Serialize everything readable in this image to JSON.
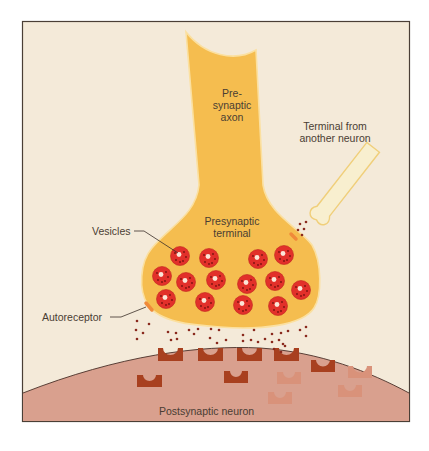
{
  "figure": {
    "colors": {
      "background": "#f4ead9",
      "frame": "#4a3f36",
      "axon_fill": "#f5bd4f",
      "axon_outline": "#fbe0a0",
      "vesicle": "#e2302a",
      "vesicle_dot": "#7a1410",
      "neurotransmitter": "#8a2a1e",
      "postsynaptic": "#d9a08e",
      "receptor_dark": "#a8401f",
      "receptor_faded": "#d9927a",
      "autoreceptor_patch": "#f08a3a",
      "other_terminal_fill": "#f8efcf",
      "other_terminal_outline": "#f0cf7a"
    }
  },
  "labels": {
    "axon_line1": "Pre-",
    "axon_line2": "synaptic",
    "axon_line3": "axon",
    "terminal_line1": "Presynaptic",
    "terminal_line2": "terminal",
    "other_line1": "Terminal from",
    "other_line2": "another neuron",
    "vesicles": "Vesicles",
    "autoreceptor": "Autoreceptor",
    "postsynaptic": "Postsynaptic neuron"
  },
  "vesicles": [
    {
      "x": 180,
      "y": 256
    },
    {
      "x": 209,
      "y": 258
    },
    {
      "x": 258,
      "y": 259
    },
    {
      "x": 284,
      "y": 255
    },
    {
      "x": 162,
      "y": 276
    },
    {
      "x": 186,
      "y": 282
    },
    {
      "x": 216,
      "y": 280
    },
    {
      "x": 247,
      "y": 284
    },
    {
      "x": 275,
      "y": 281
    },
    {
      "x": 301,
      "y": 290
    },
    {
      "x": 166,
      "y": 299
    },
    {
      "x": 205,
      "y": 302
    },
    {
      "x": 243,
      "y": 305
    },
    {
      "x": 278,
      "y": 306
    }
  ]
}
